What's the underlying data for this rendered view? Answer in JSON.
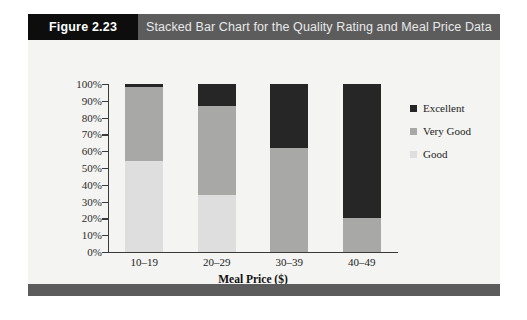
{
  "figure": {
    "number_label": "Figure 2.23",
    "title": "Stacked Bar Chart for the Quality Rating and Meal Price Data"
  },
  "chart_data": {
    "type": "bar",
    "stacked": true,
    "title": "Stacked Bar Chart for the Quality Rating and Meal Price Data",
    "categories": [
      "10–19",
      "20–29",
      "30–39",
      "40–49"
    ],
    "series": [
      {
        "name": "Good",
        "color": "#dedede",
        "values": [
          54,
          34,
          0,
          0
        ]
      },
      {
        "name": "Very Good",
        "color": "#a8a8a6",
        "values": [
          44,
          53,
          62,
          20
        ]
      },
      {
        "name": "Excellent",
        "color": "#262626",
        "values": [
          2,
          13,
          38,
          80
        ]
      }
    ],
    "xlabel": "Meal Price ($)",
    "ylabel": "",
    "ylim": [
      0,
      100
    ],
    "ytick_labels": [
      "0%",
      "10%",
      "20%",
      "30%",
      "40%",
      "50%",
      "60%",
      "70%",
      "80%",
      "90%",
      "100%"
    ],
    "ytick_values": [
      0,
      10,
      20,
      30,
      40,
      50,
      60,
      70,
      80,
      90,
      100
    ],
    "grid": false,
    "legend_position": "right",
    "legend_order": [
      "Excellent",
      "Very Good",
      "Good"
    ]
  },
  "colors": {
    "header_bar": "#5c5c5c",
    "number_tag": "#0d0d0d",
    "excellent": "#262626",
    "very_good": "#a8a8a6",
    "good": "#dedede"
  }
}
